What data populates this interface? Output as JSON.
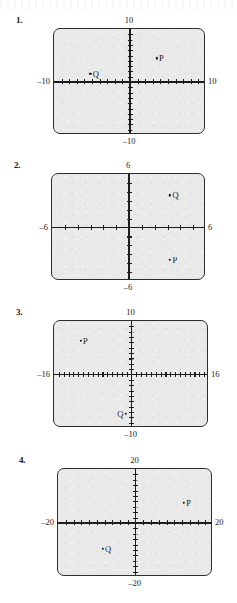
{
  "page": {
    "background_color": "#ffffff",
    "plot_fill_color": "#e9e9e9",
    "ink_color": "#1d1d1d"
  },
  "problems": [
    {
      "number": "1.",
      "frame": {
        "left": 53,
        "top": 28,
        "width": 152,
        "height": 106
      },
      "number_pos": {
        "left": 16,
        "top": 15
      },
      "chart_data": {
        "type": "scatter",
        "title": "",
        "xlabel": "",
        "ylabel": "",
        "grid": false,
        "legend": "none",
        "xlim": [
          -10,
          10
        ],
        "ylim": [
          -10,
          10
        ],
        "axis_labels": {
          "top": "10",
          "right": "10",
          "bottom": "–10",
          "left": "–10"
        },
        "x_tick_count": 20,
        "y_tick_count": 20,
        "points": [
          {
            "name": "P",
            "x": 3.5,
            "y": 4.5,
            "label_side": "right"
          },
          {
            "name": "Q",
            "x": -5.2,
            "y": 1.6,
            "label_side": "right"
          }
        ]
      }
    },
    {
      "number": "2.",
      "frame": {
        "left": 51,
        "top": 173,
        "width": 154,
        "height": 107
      },
      "number_pos": {
        "left": 14,
        "top": 160
      },
      "chart_data": {
        "type": "scatter",
        "title": "",
        "xlabel": "",
        "ylabel": "",
        "grid": false,
        "legend": "none",
        "xlim": [
          -6,
          6
        ],
        "ylim": [
          -6,
          6
        ],
        "axis_labels": {
          "top": "6",
          "right": "6",
          "bottom": "–6",
          "left": "–6"
        },
        "x_tick_count": 12,
        "y_tick_count": 12,
        "points": [
          {
            "name": "Q",
            "x": 3.2,
            "y": 3.6,
            "label_side": "right"
          },
          {
            "name": "P",
            "x": 3.2,
            "y": -3.6,
            "label_side": "right"
          }
        ]
      }
    },
    {
      "number": "3.",
      "frame": {
        "left": 53,
        "top": 320,
        "width": 155,
        "height": 107
      },
      "number_pos": {
        "left": 16,
        "top": 307
      },
      "chart_data": {
        "type": "scatter",
        "title": "",
        "xlabel": "",
        "ylabel": "",
        "grid": false,
        "legend": "none",
        "xlim": [
          -16,
          16
        ],
        "ylim": [
          -10,
          10
        ],
        "axis_labels": {
          "top": "10",
          "right": "16",
          "bottom": "–10",
          "left": "–16"
        },
        "x_tick_count": 32,
        "y_tick_count": 20,
        "points": [
          {
            "name": "P",
            "x": -10.5,
            "y": 6.3,
            "label_side": "right"
          },
          {
            "name": "Q",
            "x": -1.2,
            "y": -7.4,
            "label_side": "left"
          }
        ]
      }
    },
    {
      "number": "4.",
      "frame": {
        "left": 57,
        "top": 468,
        "width": 155,
        "height": 108
      },
      "number_pos": {
        "left": 19,
        "top": 455
      },
      "chart_data": {
        "type": "scatter",
        "title": "",
        "xlabel": "",
        "ylabel": "",
        "grid": false,
        "legend": "none",
        "xlim": [
          -20,
          20
        ],
        "ylim": [
          -20,
          20
        ],
        "axis_labels": {
          "top": "20",
          "right": "20",
          "bottom": "–20",
          "left": "–20"
        },
        "x_tick_count": 20,
        "y_tick_count": 20,
        "points": [
          {
            "name": "P",
            "x": 12.5,
            "y": 7.5,
            "label_side": "right"
          },
          {
            "name": "Q",
            "x": -8.5,
            "y": -9.5,
            "label_side": "right"
          }
        ]
      }
    }
  ]
}
